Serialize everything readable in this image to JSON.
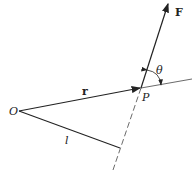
{
  "diagram": {
    "type": "vector-geometry",
    "labels": {
      "origin": "O",
      "point": "P",
      "position_vector": "r",
      "force": "F",
      "angle": "θ",
      "lever_arm": "l"
    },
    "color": "#222222"
  }
}
